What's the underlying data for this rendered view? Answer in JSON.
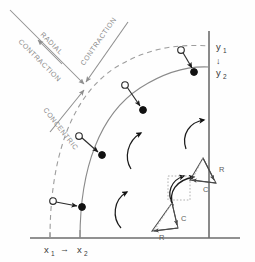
{
  "figure": {
    "background_color": "#fefefe",
    "width": 255,
    "height": 262
  },
  "annotations": {
    "radial_label_line1": "RADIAL",
    "radial_label_line2": "CONTRACTION",
    "contraction_label": "CONTRACTION",
    "concentric_label": "CONCENTRIC"
  },
  "axes": {
    "y_top_label": "y",
    "y_top_sub": "1",
    "y_bottom_label": "y",
    "y_bottom_sub": "2",
    "y_arrow_glyph": "↓",
    "x_left_label": "x",
    "x_left_sub": "1",
    "x_right_label": "x",
    "x_right_sub": "2",
    "x_arrow_glyph": "→",
    "axis_color": "#6d6d6d"
  },
  "arcs": {
    "outer_dashed_name": "initial-position-arc",
    "outer_dashed_style": "dashed",
    "inner_solid_name": "contracted-position-arc",
    "inner_solid_style": "solid",
    "dashed_color": "#9d9d9d",
    "solid_color": "#8a8a8a"
  },
  "displacement_vectors": [
    {
      "id": 1,
      "open_marker": "start-point",
      "filled_marker": "end-point"
    },
    {
      "id": 2,
      "open_marker": "start-point",
      "filled_marker": "end-point"
    },
    {
      "id": 3,
      "open_marker": "start-point",
      "filled_marker": "end-point"
    },
    {
      "id": 4,
      "open_marker": "start-point",
      "filled_marker": "end-point"
    }
  ],
  "rotation_arrows": [
    {
      "id": 1,
      "name": "rotation-arc-upper-left"
    },
    {
      "id": 2,
      "name": "rotation-arc-upper-right"
    },
    {
      "id": 3,
      "name": "rotation-arc-lower-left"
    },
    {
      "id": 4,
      "name": "rotation-arc-lower-right"
    }
  ],
  "component_triangles": [
    {
      "id": "upper",
      "radial_label": "R",
      "concentric_label": "C",
      "name": "component-triangle-upper"
    },
    {
      "id": "lower",
      "radial_label": "R",
      "concentric_label": "C",
      "name": "component-triangle-lower"
    }
  ],
  "colors": {
    "marker_fill": "#111111",
    "marker_open_fill": "#ffffff",
    "vector_stroke": "#2b2b2b",
    "label_text": "#8a8a8a",
    "axis_text": "#3a3a3a"
  }
}
